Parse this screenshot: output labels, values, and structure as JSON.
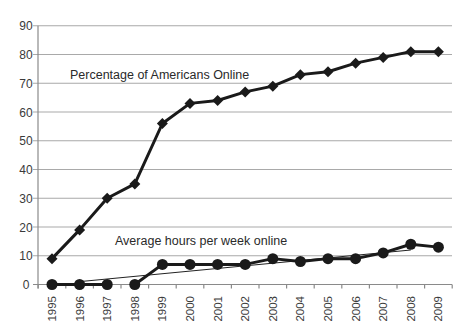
{
  "chart_data": {
    "type": "line",
    "title": "",
    "xlabel": "",
    "ylabel": "",
    "ylim": [
      0,
      90
    ],
    "yticks": [
      0,
      10,
      20,
      30,
      40,
      50,
      60,
      70,
      80,
      90
    ],
    "grid": true,
    "legend": "none (inline annotations)",
    "categories": [
      "1995",
      "1996",
      "1997",
      "1998",
      "1999",
      "2000",
      "2001",
      "2002",
      "2003",
      "2004",
      "2005",
      "2006",
      "2007",
      "2008",
      "2009"
    ],
    "series": [
      {
        "name": "Percentage of Americans Online",
        "marker": "diamond",
        "values": [
          9,
          19,
          30,
          35,
          56,
          63,
          64,
          67,
          69,
          73,
          74,
          77,
          79,
          81,
          81
        ]
      },
      {
        "name": "Average hours per week online",
        "marker": "circle",
        "values": [
          0,
          0,
          0,
          0,
          7,
          7,
          7,
          7,
          9,
          8,
          9,
          9,
          11,
          14,
          13
        ],
        "gap_after_index": 2
      },
      {
        "name": "Linear trend (hours)",
        "type": "trendline",
        "from": {
          "x": "1996",
          "y": 1
        },
        "to": {
          "x": "2008",
          "y": 12
        }
      }
    ],
    "annotations": [
      {
        "text": "Percentage of Americans Online",
        "x": 70,
        "y": 75
      },
      {
        "text": "Average hours per week online",
        "x": 115,
        "y": 241
      }
    ]
  },
  "labels": {
    "pct_series": "Percentage of Americans Online",
    "hours_series": "Average hours per week online"
  },
  "colors": {
    "line": "#1a1a1a",
    "grid": "#a9a9a9",
    "text": "#3a3a3a",
    "background": "#ffffff"
  }
}
